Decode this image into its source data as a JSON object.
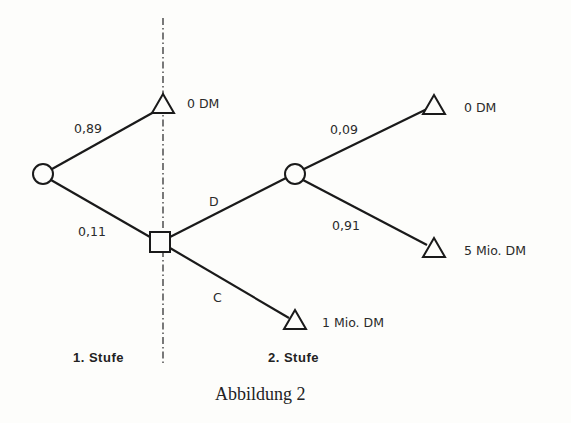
{
  "diagram": {
    "type": "decision-tree",
    "caption": "Abbildung 2",
    "stages": [
      "1. Stufe",
      "2. Stufe"
    ],
    "nodes": {
      "root": {
        "shape": "chance-circle"
      },
      "decision": {
        "shape": "decision-square"
      },
      "chance2": {
        "shape": "chance-circle"
      },
      "leaf_top": {
        "shape": "end-triangle",
        "label": "0 DM"
      },
      "leaf_c": {
        "shape": "end-triangle",
        "label": "1 Mio. DM"
      },
      "leaf_d1": {
        "shape": "end-triangle",
        "label": "0 DM"
      },
      "leaf_d2": {
        "shape": "end-triangle",
        "label": "5 Mio. DM"
      }
    },
    "edges": {
      "root_top": {
        "label": "0,89"
      },
      "root_decision": {
        "label": "0,11"
      },
      "decision_d": {
        "label": "D"
      },
      "decision_c": {
        "label": "C"
      },
      "chance2_top": {
        "label": "0,09"
      },
      "chance2_bottom": {
        "label": "0,91"
      }
    }
  }
}
